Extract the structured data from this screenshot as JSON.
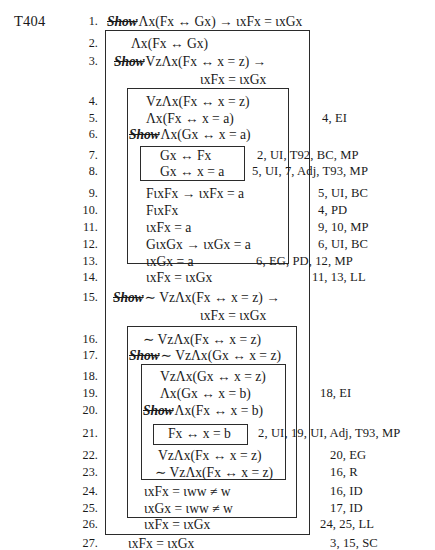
{
  "document": {
    "type": "logic-proof",
    "theorem_label": "T404",
    "title": "T404 derivation"
  },
  "lines": [
    {
      "n": "1.",
      "show": true,
      "formula": "Λx(Fx ↔ Gx) → ɩxFx = ɩxGx",
      "cont": "",
      "just": ""
    },
    {
      "n": "2.",
      "show": false,
      "formula": "Λx(Fx ↔ Gx)",
      "cont": "",
      "just": ""
    },
    {
      "n": "3.",
      "show": true,
      "formula": "VzΛx(Fx ↔ x = z) →",
      "cont": "ɩxFx = ɩxGx",
      "just": ""
    },
    {
      "n": "4.",
      "show": false,
      "formula": "VzΛx(Fx ↔ x = z)",
      "cont": "",
      "just": ""
    },
    {
      "n": "5.",
      "show": false,
      "formula": "Λx(Fx ↔ x = a)",
      "cont": "",
      "just": "4, EI"
    },
    {
      "n": "6.",
      "show": true,
      "formula": "Λx(Gx ↔ x = a)",
      "cont": "",
      "just": ""
    },
    {
      "n": "7.",
      "show": false,
      "formula": "Gx ↔ Fx",
      "cont": "",
      "just": "2, UI, T92, BC, MP"
    },
    {
      "n": "8.",
      "show": false,
      "formula": "Gx ↔ x = a",
      "cont": "",
      "just": "5, UI, 7, Adj, T93, MP"
    },
    {
      "n": "9.",
      "show": false,
      "formula": "FɩxFx → ɩxFx = a",
      "cont": "",
      "just": "5, UI, BC"
    },
    {
      "n": "10.",
      "show": false,
      "formula": "FɩxFx",
      "cont": "",
      "just": "4, PD"
    },
    {
      "n": "11.",
      "show": false,
      "formula": "ɩxFx = a",
      "cont": "",
      "just": "9, 10, MP"
    },
    {
      "n": "12.",
      "show": false,
      "formula": "GɩxGx → ɩxGx = a",
      "cont": "",
      "just": "6, UI, BC"
    },
    {
      "n": "13.",
      "show": false,
      "formula": "ɩxGx = a",
      "cont": "",
      "just": "6, EG, PD, 12, MP"
    },
    {
      "n": "14.",
      "show": false,
      "formula": "ɩxFx = ɩxGx",
      "cont": "",
      "just": "11, 13, LL"
    },
    {
      "n": "15.",
      "show": true,
      "formula": "∼ VzΛx(Fx ↔ x = z) →",
      "cont": "ɩxFx = ɩxGx",
      "just": ""
    },
    {
      "n": "16.",
      "show": false,
      "formula": "∼ VzΛx(Fx ↔ x = z)",
      "cont": "",
      "just": ""
    },
    {
      "n": "17.",
      "show": true,
      "formula": "∼ VzΛx(Gx ↔ x = z)",
      "cont": "",
      "just": ""
    },
    {
      "n": "18.",
      "show": false,
      "formula": "VzΛx(Gx ↔ x = z)",
      "cont": "",
      "just": ""
    },
    {
      "n": "19.",
      "show": false,
      "formula": "Λx(Gx ↔ x = b)",
      "cont": "",
      "just": "18, EI"
    },
    {
      "n": "20.",
      "show": true,
      "formula": "Λx(Fx ↔ x = b)",
      "cont": "",
      "just": ""
    },
    {
      "n": "21.",
      "show": false,
      "formula": "Fx ↔ x = b",
      "cont": "",
      "just": "2, UI, 19, UI, Adj, T93, MP"
    },
    {
      "n": "22.",
      "show": false,
      "formula": "VzΛx(Fx ↔ x = z)",
      "cont": "",
      "just": "20, EG"
    },
    {
      "n": "23.",
      "show": false,
      "formula": "∼ VzΛx(Fx ↔ x = z)",
      "cont": "",
      "just": "16, R"
    },
    {
      "n": "24.",
      "show": false,
      "formula": "ɩxFx = ɩww ≠ w",
      "cont": "",
      "just": "16, ID"
    },
    {
      "n": "25.",
      "show": false,
      "formula": "ɩxGx = ɩww ≠ w",
      "cont": "",
      "just": "17, ID"
    },
    {
      "n": "26.",
      "show": false,
      "formula": "ɩxFx = ɩxGx",
      "cont": "",
      "just": "24, 25, LL"
    },
    {
      "n": "27.",
      "show": false,
      "formula": "ɩxFx = ɩxGx",
      "cont": "",
      "just": "3, 15, SC"
    }
  ],
  "labels": {
    "show_word": "Show"
  }
}
